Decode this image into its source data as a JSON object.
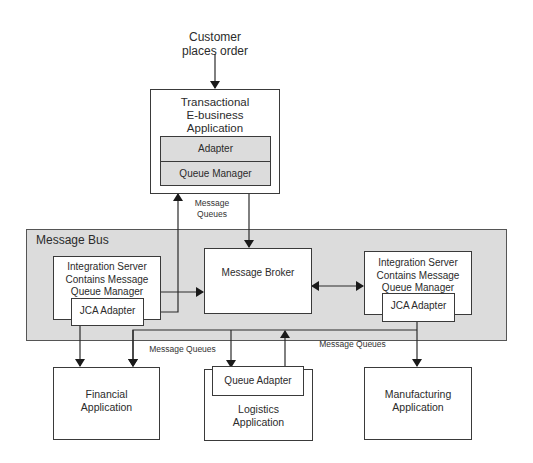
{
  "diagram": {
    "trigger_label": "Customer\nplaces order",
    "transactional_app": {
      "title": "Transactional\nE-business\nApplication",
      "adapter": "Adapter",
      "queue_manager": "Queue Manager"
    },
    "message_queues_top": "Message\nQueues",
    "message_bus": {
      "title": "Message Bus",
      "left_server": {
        "title": "Integration Server\nContains Message\nQueue Manager",
        "adapter": "JCA Adapter"
      },
      "broker": "Message Broker",
      "right_server": {
        "title": "Integration Server\nContains Message\nQueue Manager",
        "adapter": "JCA Adapter"
      }
    },
    "message_queues_left": "Message Queues",
    "message_queues_right": "Message Queues",
    "financial_app": "Financial\nApplication",
    "logistics_app": {
      "adapter": "Queue Adapter",
      "title": "Logistics\nApplication"
    },
    "manufacturing_app": "Manufacturing\nApplication"
  }
}
